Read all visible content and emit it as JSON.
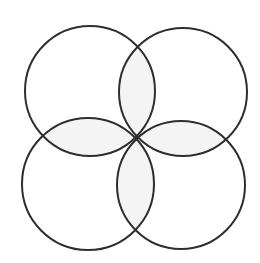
{
  "diagram": {
    "title": "",
    "stroke_color": "#2e2e2e",
    "stroke_width": 2,
    "background": "#ffffff",
    "overlap_fill": "#f4f4f4",
    "circles": [
      {
        "name": "top-left",
        "cx": 90,
        "cy": 91,
        "r": 65
      },
      {
        "name": "top-right",
        "cx": 183,
        "cy": 92,
        "r": 64
      },
      {
        "name": "bottom-left",
        "cx": 88,
        "cy": 184,
        "r": 66
      },
      {
        "name": "bottom-right",
        "cx": 181,
        "cy": 185,
        "r": 64
      }
    ],
    "labels": []
  }
}
